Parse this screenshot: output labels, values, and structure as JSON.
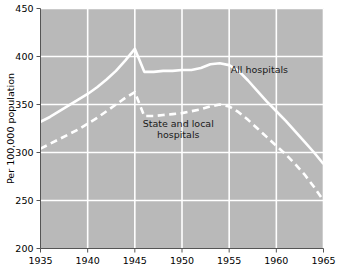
{
  "chart_data": {
    "type": "line",
    "title": "",
    "subtitle": "",
    "xlabel": "",
    "ylabel": "Per 100,000 population",
    "xlim": [
      1935,
      1965
    ],
    "ylim": [
      200,
      450
    ],
    "xticks": [
      1935,
      1940,
      1945,
      1950,
      1955,
      1960,
      1965
    ],
    "yticks": [
      200,
      250,
      300,
      350,
      400,
      450
    ],
    "xtick_labels": [
      "1935",
      "1940",
      "1945",
      "1950",
      "1955",
      "1960",
      "1965"
    ],
    "ytick_labels": [
      "200",
      "250",
      "300",
      "350",
      "400",
      "450"
    ],
    "grid": true,
    "grid_color": "#ffffff",
    "plot_background": "#b9b9b9",
    "figure_background": "#ffffff",
    "legend": "inline-annotations",
    "series": [
      {
        "name": "All hospitals",
        "style": "solid",
        "color": "#ffffff",
        "annotation": "All hospitals",
        "annotation_x": 1958.2,
        "annotation_y": 383,
        "x": [
          1935,
          1936,
          1937,
          1938,
          1939,
          1940,
          1941,
          1942,
          1943,
          1944,
          1945,
          1946,
          1947,
          1948,
          1949,
          1950,
          1951,
          1952,
          1953,
          1954,
          1955,
          1956,
          1957,
          1958,
          1959,
          1960,
          1961,
          1962,
          1963,
          1964,
          1965
        ],
        "values": [
          332,
          337,
          343,
          349,
          355,
          361,
          368,
          376,
          385,
          396,
          408,
          384,
          384,
          385,
          385,
          386,
          386,
          388,
          392,
          393,
          391,
          385,
          375,
          364,
          353,
          343,
          333,
          322,
          311,
          300,
          288
        ]
      },
      {
        "name": "State and local hospitals",
        "style": "dashed",
        "color": "#ffffff",
        "annotation": "State and local hospitals",
        "annotation_line_1": "State and local",
        "annotation_line_2": "hospitals",
        "annotation_x": 1949.6,
        "annotation_y": 327,
        "x": [
          1935,
          1936,
          1937,
          1938,
          1939,
          1940,
          1941,
          1942,
          1943,
          1944,
          1945,
          1946,
          1947,
          1948,
          1949,
          1950,
          1951,
          1952,
          1953,
          1954,
          1955,
          1956,
          1957,
          1958,
          1959,
          1960,
          1961,
          1962,
          1963,
          1964,
          1965
        ],
        "values": [
          304,
          309,
          314,
          319,
          324,
          330,
          336,
          343,
          350,
          357,
          363,
          338,
          338,
          339,
          340,
          341,
          343,
          345,
          348,
          350,
          348,
          342,
          334,
          325,
          316,
          307,
          298,
          288,
          277,
          264,
          250
        ]
      }
    ]
  }
}
